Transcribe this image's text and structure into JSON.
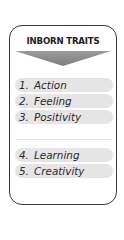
{
  "card": {
    "title": "INBORN TRAITS",
    "arrow_icon": "downward-chevron-arrow",
    "colors": {
      "border": "#3a3a3a",
      "pill_background": "#e5e5e5",
      "arrow_fill": "#8c8c8c",
      "text": "#2a2a2a"
    },
    "groups": [
      {
        "items": [
          {
            "number": "1.",
            "label": "Action"
          },
          {
            "number": "2.",
            "label": "Feeling"
          },
          {
            "number": "3.",
            "label": "Positivity"
          }
        ]
      },
      {
        "items": [
          {
            "number": "4.",
            "label": "Learning"
          },
          {
            "number": "5.",
            "label": "Creativity"
          }
        ]
      }
    ]
  }
}
